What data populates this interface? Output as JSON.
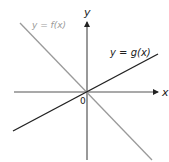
{
  "figure": {
    "axes": {
      "x_label": "x",
      "y_label": "y",
      "origin_label": "0"
    },
    "curves": [
      {
        "name": "f",
        "label": "y = f(x)",
        "color": "#9a9a9a",
        "slope_sign": "negative"
      },
      {
        "name": "g",
        "label": "y = g(x)",
        "color": "#222222",
        "slope_sign": "positive"
      }
    ]
  }
}
